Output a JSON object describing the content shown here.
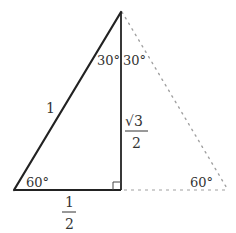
{
  "diagram": {
    "type": "geometry-triangle",
    "colors": {
      "solid_line": "#222222",
      "dotted_line": "#9a9a9a",
      "text": "#333333",
      "background": "#ffffff"
    },
    "vertices": {
      "apex": [
        121,
        12
      ],
      "bottom_left": [
        14,
        190
      ],
      "foot": [
        121,
        190
      ],
      "bottom_right_dotted": [
        228,
        190
      ]
    },
    "labels": {
      "hypotenuse": "1",
      "vertical_side_numerator": "√3",
      "vertical_side_denominator": "2",
      "base_numerator": "1",
      "base_denominator": "2",
      "apex_angle_left": "30°",
      "apex_angle_right": "30°",
      "bottom_left_angle": "60°",
      "bottom_right_angle": "60°"
    },
    "right_angle_marker": true
  }
}
